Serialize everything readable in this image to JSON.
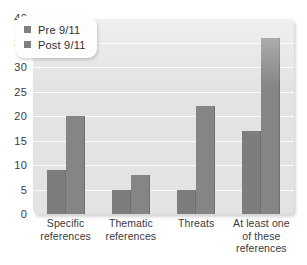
{
  "chart_data": {
    "type": "bar",
    "title": "",
    "subtitle": "",
    "xlabel": "",
    "ylabel": "",
    "ylim": [
      0,
      40
    ],
    "ytick_step": 5,
    "yticks": [
      40,
      35,
      30,
      25,
      20,
      15,
      10,
      5,
      0
    ],
    "grid": true,
    "legend_position": "top-left",
    "categories": [
      "Specific references",
      "Thematic references",
      "Threats",
      "At least one of these references"
    ],
    "category_lines": [
      [
        "Specific",
        "references"
      ],
      [
        "Thematic",
        "references"
      ],
      [
        "Threats"
      ],
      [
        "At least one",
        "of these",
        "references"
      ]
    ],
    "series": [
      {
        "name": "Pre 9/11",
        "values": [
          9,
          5,
          5,
          17
        ]
      },
      {
        "name": "Post 9/11",
        "values": [
          20,
          8,
          22,
          36
        ]
      }
    ],
    "colors": {
      "pre": "#7d7d7d",
      "post": "#858585",
      "plot_background": "#e3e3e3",
      "gridline": "#fbfbfb",
      "page_background": "#ffffff",
      "text": "#3a3a3a"
    }
  },
  "legend": {
    "entries": [
      {
        "label": "Pre 9/11",
        "swatch": "#7f7f7f"
      },
      {
        "label": "Post 9/11",
        "swatch": "#7f7f7f"
      }
    ]
  }
}
